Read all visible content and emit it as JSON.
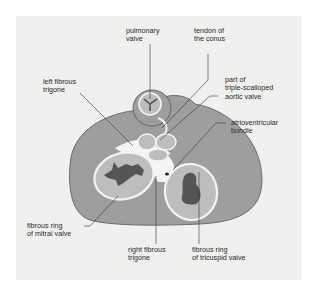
{
  "labels": {
    "pulmonary_valve": "pulmonary\nvalve",
    "tendon_of_conus": "tendon of\nthe conus",
    "left_fibrous_trigone": "left fibrous\ntrigone",
    "aortic_valve": "part of\ntriple-scalloped\naortic valve",
    "atrioventricular_bundle": "atrioventricular\nbundle",
    "fibrous_ring_mitral": "fibrous ring\nof mitral valve",
    "right_fibrous_trigone": "right fibrous\ntrigone",
    "fibrous_ring_tricuspid": "fibrous ring\nof tricuspid valve"
  },
  "colors": {
    "panel_bg": "#f0f0ef",
    "heart_base": "#9e9e9e",
    "valve_area": "#bdbdbd",
    "skeleton": "#f4f4f4",
    "orifice": "#555555",
    "leader_line": "#333333"
  }
}
